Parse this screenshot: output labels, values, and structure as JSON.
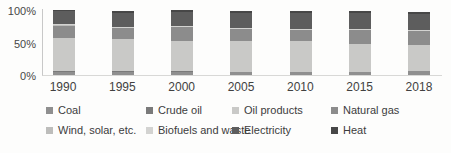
{
  "chart_data": {
    "type": "bar",
    "stacked": true,
    "unit": "percent",
    "categories": [
      "1990",
      "1995",
      "2000",
      "2005",
      "2010",
      "2015",
      "2018"
    ],
    "series": [
      {
        "name": "Coal",
        "color": "#8f8f8f",
        "values": [
          5.0,
          5.0,
          5.0,
          4.5,
          4.0,
          4.5,
          5.5
        ]
      },
      {
        "name": "Crude oil",
        "color": "#7a7a7a",
        "values": [
          0.5,
          0.4,
          0.4,
          0.4,
          0.3,
          0.3,
          0.3
        ]
      },
      {
        "name": "Oil products",
        "color": "#c9c9c7",
        "values": [
          50.0,
          48.5,
          46.5,
          46.0,
          47.5,
          41.5,
          39.5
        ]
      },
      {
        "name": "Natural gas",
        "color": "#8c8c8c",
        "values": [
          19.5,
          17.5,
          21.0,
          19.0,
          16.5,
          21.5,
          21.0
        ]
      },
      {
        "name": "Wind, solar, etc.",
        "color": "#bdbdbb",
        "values": [
          0.4,
          0.4,
          0.4,
          0.4,
          0.4,
          0.4,
          0.4
        ]
      },
      {
        "name": "Biofuels and waste",
        "color": "#d3d3d1",
        "values": [
          1.2,
          1.3,
          1.3,
          1.3,
          1.4,
          1.4,
          1.4
        ]
      },
      {
        "name": "Electricity",
        "color": "#5d5d5d",
        "values": [
          20.0,
          21.5,
          21.0,
          23.0,
          24.0,
          24.5,
          24.5
        ]
      },
      {
        "name": "Heat",
        "color": "#474747",
        "values": [
          2.5,
          2.5,
          2.5,
          2.5,
          2.5,
          2.5,
          2.5
        ]
      }
    ],
    "yticks": [
      "100%",
      "50%",
      "0%"
    ],
    "ylim": [
      0,
      100
    ],
    "grid": false,
    "legend_position": "bottom"
  }
}
